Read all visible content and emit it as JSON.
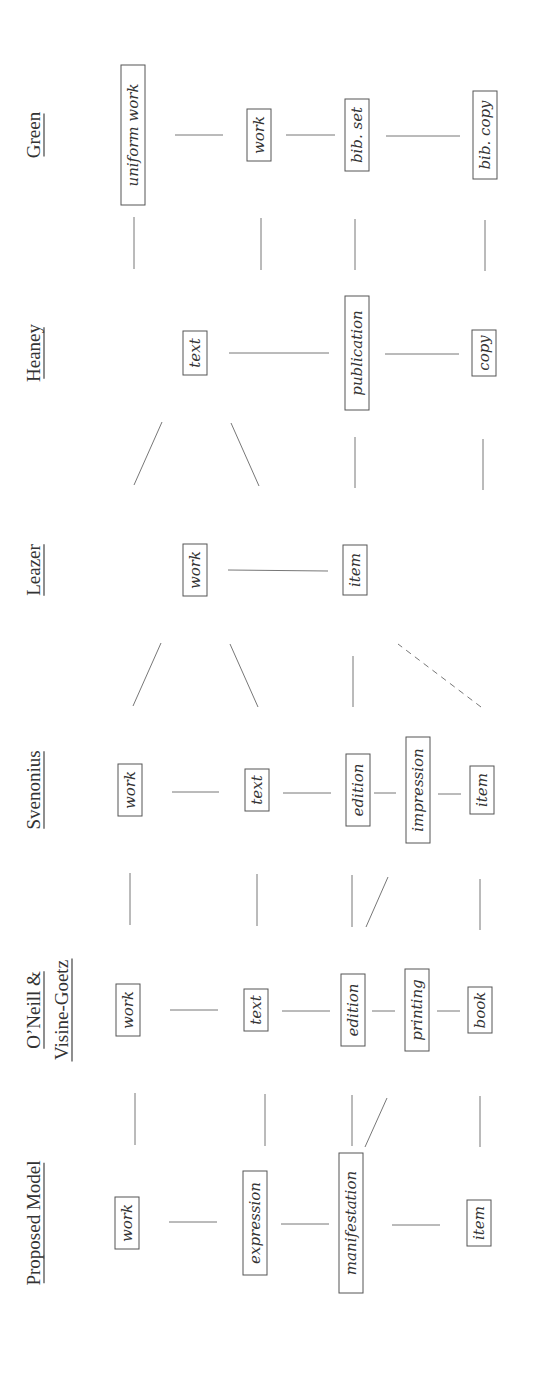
{
  "figure": {
    "orientation": "rotated-90-ccw"
  },
  "columns": [
    {
      "id": "green",
      "header": [
        "Green"
      ],
      "y": 135,
      "entities": [
        {
          "label": "uniform work",
          "x": 133,
          "h": 140
        },
        {
          "label": "work",
          "x": 259,
          "h": 52
        },
        {
          "label": "bib. set",
          "x": 357,
          "h": 72
        },
        {
          "label": "bib. copy",
          "x": 485,
          "h": 88
        }
      ],
      "links": [
        {
          "x1": 175,
          "y1": 135,
          "x2": 223,
          "y2": 135
        },
        {
          "x1": 286,
          "y1": 135,
          "x2": 335,
          "y2": 135
        },
        {
          "x1": 386,
          "y1": 136,
          "x2": 460,
          "y2": 136
        }
      ]
    },
    {
      "id": "heaney",
      "header": [
        "Heaney"
      ],
      "y": 353,
      "entities": [
        {
          "label": "text",
          "x": 195,
          "h": 44
        },
        {
          "label": "publication",
          "x": 357,
          "h": 114
        },
        {
          "label": "copy",
          "x": 484,
          "h": 46
        }
      ],
      "links": [
        {
          "x1": 229,
          "y1": 353,
          "x2": 329,
          "y2": 353
        },
        {
          "x1": 385,
          "y1": 354,
          "x2": 459,
          "y2": 354
        }
      ]
    },
    {
      "id": "leazer",
      "header": [
        "Leazer"
      ],
      "y": 570,
      "entities": [
        {
          "label": "work",
          "x": 195,
          "h": 52
        },
        {
          "label": "item",
          "x": 355,
          "h": 50
        }
      ],
      "links": [
        {
          "x1": 228,
          "y1": 570,
          "x2": 328,
          "y2": 571
        }
      ]
    },
    {
      "id": "svenonius",
      "header": [
        "Svenonius"
      ],
      "y": 790,
      "entities": [
        {
          "label": "work",
          "x": 130,
          "h": 52
        },
        {
          "label": "text",
          "x": 257,
          "h": 42
        },
        {
          "label": "edition",
          "x": 358,
          "h": 72
        },
        {
          "label": "impression",
          "x": 418,
          "h": 106
        },
        {
          "label": "item",
          "x": 482,
          "h": 48
        }
      ],
      "links": [
        {
          "x1": 172,
          "y1": 792,
          "x2": 219,
          "y2": 792
        },
        {
          "x1": 283,
          "y1": 793,
          "x2": 331,
          "y2": 793
        },
        {
          "x1": 374,
          "y1": 793,
          "x2": 396,
          "y2": 793
        },
        {
          "x1": 438,
          "y1": 794,
          "x2": 461,
          "y2": 794
        }
      ]
    },
    {
      "id": "oneill",
      "header": [
        "O’Neill &",
        "Visine-Goetz"
      ],
      "y": 1010,
      "entities": [
        {
          "label": "work",
          "x": 128,
          "h": 52
        },
        {
          "label": "text",
          "x": 256,
          "h": 42
        },
        {
          "label": "edition",
          "x": 353,
          "h": 72
        },
        {
          "label": "printing",
          "x": 417,
          "h": 82
        },
        {
          "label": "book",
          "x": 480,
          "h": 46
        }
      ],
      "links": [
        {
          "x1": 170,
          "y1": 1010,
          "x2": 218,
          "y2": 1010
        },
        {
          "x1": 282,
          "y1": 1011,
          "x2": 330,
          "y2": 1011
        },
        {
          "x1": 372,
          "y1": 1011,
          "x2": 395,
          "y2": 1011
        },
        {
          "x1": 437,
          "y1": 1011,
          "x2": 460,
          "y2": 1011
        }
      ]
    },
    {
      "id": "proposed",
      "header": [
        "Proposed Model"
      ],
      "y": 1223,
      "entities": [
        {
          "label": "work",
          "x": 127,
          "h": 52
        },
        {
          "label": "expression",
          "x": 255,
          "h": 104
        },
        {
          "label": "manifestation",
          "x": 351,
          "h": 140
        },
        {
          "label": "item",
          "x": 479,
          "h": 46
        }
      ],
      "links": [
        {
          "x1": 169,
          "y1": 1222,
          "x2": 217,
          "y2": 1222
        },
        {
          "x1": 281,
          "y1": 1224,
          "x2": 329,
          "y2": 1224
        },
        {
          "x1": 392,
          "y1": 1225,
          "x2": 440,
          "y2": 1225
        }
      ]
    }
  ],
  "between_links": [
    {
      "x1": 135,
      "y1": 1093,
      "x2": 135,
      "y2": 1145,
      "style": "solid"
    },
    {
      "x1": 265,
      "y1": 1094,
      "x2": 265,
      "y2": 1146,
      "style": "solid"
    },
    {
      "x1": 352,
      "y1": 1095,
      "x2": 352,
      "y2": 1146,
      "style": "solid"
    },
    {
      "x1": 365,
      "y1": 1147,
      "x2": 387,
      "y2": 1098,
      "style": "solid"
    },
    {
      "x1": 480,
      "y1": 1096,
      "x2": 480,
      "y2": 1147,
      "style": "solid"
    },
    {
      "x1": 130,
      "y1": 873,
      "x2": 130,
      "y2": 925,
      "style": "solid"
    },
    {
      "x1": 257,
      "y1": 874,
      "x2": 257,
      "y2": 926,
      "style": "solid"
    },
    {
      "x1": 352,
      "y1": 875,
      "x2": 352,
      "y2": 927,
      "style": "solid"
    },
    {
      "x1": 366,
      "y1": 927,
      "x2": 388,
      "y2": 877,
      "style": "solid"
    },
    {
      "x1": 480,
      "y1": 879,
      "x2": 480,
      "y2": 930,
      "style": "solid"
    },
    {
      "x1": 133,
      "y1": 706,
      "x2": 161,
      "y2": 643,
      "style": "solid"
    },
    {
      "x1": 258,
      "y1": 707,
      "x2": 230,
      "y2": 644,
      "style": "solid"
    },
    {
      "x1": 353,
      "y1": 707,
      "x2": 353,
      "y2": 656,
      "style": "solid"
    },
    {
      "x1": 481,
      "y1": 707,
      "x2": 398,
      "y2": 644,
      "style": "dashed"
    },
    {
      "x1": 134,
      "y1": 485,
      "x2": 162,
      "y2": 422,
      "style": "solid"
    },
    {
      "x1": 259,
      "y1": 486,
      "x2": 231,
      "y2": 423,
      "style": "solid"
    },
    {
      "x1": 355,
      "y1": 488,
      "x2": 355,
      "y2": 437,
      "style": "solid"
    },
    {
      "x1": 483,
      "y1": 490,
      "x2": 483,
      "y2": 439,
      "style": "solid"
    },
    {
      "x1": 134,
      "y1": 269,
      "x2": 134,
      "y2": 217,
      "style": "solid"
    },
    {
      "x1": 261,
      "y1": 270,
      "x2": 261,
      "y2": 218,
      "style": "solid"
    },
    {
      "x1": 355,
      "y1": 270,
      "x2": 355,
      "y2": 219,
      "style": "solid"
    },
    {
      "x1": 485,
      "y1": 271,
      "x2": 485,
      "y2": 220,
      "style": "solid"
    }
  ]
}
